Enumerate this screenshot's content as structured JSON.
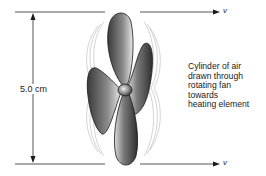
{
  "diagram": {
    "dimension_label": "5.0 cm",
    "velocity_top": "v",
    "velocity_bottom": "v",
    "caption_lines": [
      "Cylinder of air",
      "drawn through",
      "rotating fan",
      "towards",
      "heating element"
    ],
    "colors": {
      "line": "#2a2a2a",
      "blade_dark": "#3a3a3a",
      "blade_light": "#e8e8e8",
      "flow_lines": "#9a9a9a"
    }
  }
}
